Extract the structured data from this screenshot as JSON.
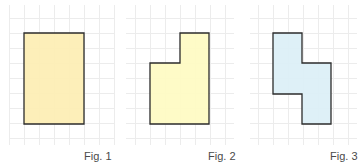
{
  "figures": [
    {
      "label": "Fig. 1",
      "fill": "#FDEEB3",
      "stroke": "#2b2b2b",
      "points": "24,33 84,33 84,124 24,124",
      "grid": {
        "x0": 9,
        "x1": 114,
        "y0": 5,
        "y1": 145
      },
      "label_pos": {
        "left": 84,
        "top": 150
      }
    },
    {
      "label": "Fig. 2",
      "fill": "#FEFBC2",
      "stroke": "#2b2b2b",
      "points": "180,33 209,33 209,124 150,124 150,63 180,63",
      "grid": {
        "x0": 126,
        "x1": 234,
        "y0": 5,
        "y1": 145
      },
      "label_pos": {
        "left": 208,
        "top": 150
      }
    },
    {
      "label": "Fig. 3",
      "fill": "#DBEFF6",
      "stroke": "#2b2b2b",
      "points": "273,33 302,33 302,63 331,63 331,124 302,124 302,94 273,94",
      "grid": {
        "x0": 250,
        "x1": 357,
        "y0": 5,
        "y1": 145
      },
      "label_pos": {
        "left": 330,
        "top": 150
      }
    }
  ],
  "grid_color": "#ececec",
  "grid_step": 15
}
